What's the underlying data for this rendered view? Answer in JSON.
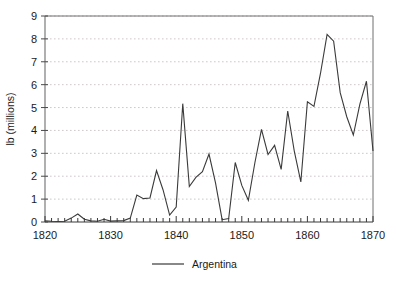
{
  "chart_data": {
    "type": "line",
    "title": "",
    "subtitle": "",
    "xlabel": "",
    "ylabel": "lb (millions)",
    "xlim": [
      1820,
      1870
    ],
    "ylim": [
      0,
      9
    ],
    "grid": "horizontal-dotted",
    "legend_position": "bottom-center",
    "xticks": [
      1820,
      1830,
      1840,
      1850,
      1860,
      1870
    ],
    "xtick_labels": [
      "1820",
      "1830",
      "1840",
      "1850",
      "1860",
      "1870"
    ],
    "minor_xtick_interval": 1,
    "yticks": [
      0,
      1,
      2,
      3,
      4,
      5,
      6,
      7,
      8,
      9
    ],
    "ytick_labels": [
      "0",
      "1",
      "2",
      "3",
      "4",
      "5",
      "6",
      "7",
      "8",
      "9"
    ],
    "series": [
      {
        "name": "Argentina",
        "color": "#3a3a3a",
        "x": [
          1820,
          1821,
          1822,
          1823,
          1824,
          1825,
          1826,
          1827,
          1828,
          1829,
          1830,
          1831,
          1832,
          1833,
          1834,
          1835,
          1836,
          1837,
          1838,
          1839,
          1840,
          1841,
          1842,
          1843,
          1844,
          1845,
          1846,
          1847,
          1848,
          1849,
          1850,
          1851,
          1852,
          1853,
          1854,
          1855,
          1856,
          1857,
          1858,
          1859,
          1860,
          1861,
          1862,
          1863,
          1864,
          1865,
          1866,
          1867,
          1868,
          1869,
          1870
        ],
        "values": [
          0.05,
          0.03,
          0.02,
          0.03,
          0.17,
          0.35,
          0.12,
          0.05,
          0.03,
          0.12,
          0.04,
          0.05,
          0.06,
          0.17,
          1.18,
          1.02,
          1.05,
          2.25,
          1.4,
          0.3,
          0.65,
          5.17,
          1.55,
          1.95,
          2.2,
          2.97,
          1.7,
          0.1,
          0.15,
          2.6,
          1.6,
          0.95,
          2.6,
          4.05,
          2.95,
          3.35,
          2.3,
          4.85,
          3.1,
          1.75,
          5.25,
          5.05,
          6.5,
          8.2,
          7.9,
          5.65,
          4.6,
          3.8,
          5.15,
          6.15,
          3.1
        ]
      }
    ]
  },
  "legend": {
    "entries": [
      {
        "label": "Argentina",
        "color": "#3a3a3a",
        "marker": "line"
      }
    ]
  },
  "axes": {
    "y_axis_title": "lb (millions)",
    "y_min_label": "0",
    "y_max_label": "9",
    "x_min_label": "1820",
    "x_max_label": "1870"
  }
}
